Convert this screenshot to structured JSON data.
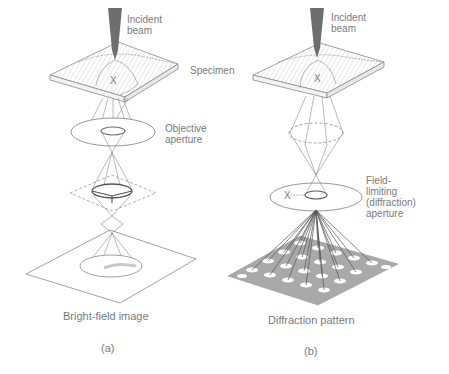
{
  "panels": [
    {
      "id": "a",
      "caption": "(a)",
      "title": "Bright-field image",
      "labels": {
        "incident_beam": "Incident\nbeam",
        "specimen": "Specimen",
        "objective_aperture": "Objective\naperture",
        "x_mark": "X"
      }
    },
    {
      "id": "b",
      "caption": "(b)",
      "title": "Diffraction pattern",
      "labels": {
        "incident_beam": "Incident\nbeam",
        "field_limiting_aperture": "Field-\nlimiting\n(diffraction)\naperture",
        "x_mark_specimen": "X",
        "x_mark_aperture": "X"
      }
    }
  ],
  "colors": {
    "line": "#8a8a8a",
    "beam": "#6e6e6e",
    "pattern_plane": "#a9a9a9",
    "spot": "#ffffff",
    "text": "#7a7a7a"
  }
}
